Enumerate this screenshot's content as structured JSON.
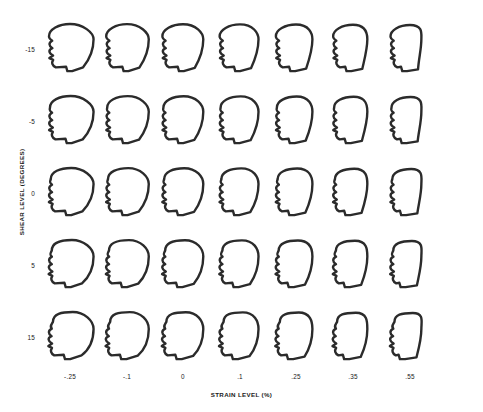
{
  "figure": {
    "type": "face-glyph-matrix",
    "title": "",
    "x_axis": {
      "label": "STRAIN LEVEL (%)",
      "ticks": [
        ".25",
        ".1",
        "0",
        ".1",
        ".25",
        ".35",
        ".55"
      ],
      "tick_display": [
        "-.25",
        "-.1",
        "0",
        ".1",
        ".25",
        ".35",
        ".55"
      ]
    },
    "y_axis": {
      "label": "SHEAR LEVEL (DEGREES)",
      "ticks": [
        "-15",
        "-5",
        "0",
        "5",
        "15"
      ]
    },
    "colors": {
      "background": "#ffffff",
      "stroke": "#2b2b2b",
      "text": "#1a1a1a"
    }
  },
  "chart_data": {
    "type": "scatter",
    "title": "",
    "xlabel": "STRAIN LEVEL (%)",
    "ylabel": "SHEAR LEVEL (DEGREES)",
    "glyph": "face-profile",
    "x": [
      -0.25,
      -0.1,
      0,
      0.1,
      0.25,
      0.35,
      0.55
    ],
    "y": [
      -15,
      -5,
      0,
      5,
      15
    ],
    "xtick_labels": [
      "-.25",
      "-.1",
      "0",
      ".1",
      ".25",
      ".35",
      ".55"
    ],
    "ytick_labels": [
      "-15",
      "-5",
      "0",
      "5",
      "15"
    ],
    "grid": false,
    "legend": "none",
    "note": "7 columns x 5 rows = 35 face glyphs; face roundness decreases and jaw angularity increases left-to-right; head tilt/elongation increases top-to-bottom",
    "cells": [
      {
        "row": 0,
        "col": 0,
        "shear": -15,
        "strain": -0.25,
        "roundness": 1.0,
        "tilt": -0.18
      },
      {
        "row": 0,
        "col": 1,
        "shear": -15,
        "strain": -0.1,
        "roundness": 0.88,
        "tilt": -0.18
      },
      {
        "row": 0,
        "col": 2,
        "shear": -15,
        "strain": 0.0,
        "roundness": 0.78,
        "tilt": -0.18
      },
      {
        "row": 0,
        "col": 3,
        "shear": -15,
        "strain": 0.1,
        "roundness": 0.66,
        "tilt": -0.18
      },
      {
        "row": 0,
        "col": 4,
        "shear": -15,
        "strain": 0.25,
        "roundness": 0.52,
        "tilt": -0.18
      },
      {
        "row": 0,
        "col": 5,
        "shear": -15,
        "strain": 0.35,
        "roundness": 0.38,
        "tilt": -0.18
      },
      {
        "row": 0,
        "col": 6,
        "shear": -15,
        "strain": 0.55,
        "roundness": 0.18,
        "tilt": -0.18
      },
      {
        "row": 1,
        "col": 0,
        "shear": -5,
        "strain": -0.25,
        "roundness": 1.0,
        "tilt": -0.08
      },
      {
        "row": 1,
        "col": 1,
        "shear": -5,
        "strain": -0.1,
        "roundness": 0.88,
        "tilt": -0.08
      },
      {
        "row": 1,
        "col": 2,
        "shear": -5,
        "strain": 0.0,
        "roundness": 0.78,
        "tilt": -0.08
      },
      {
        "row": 1,
        "col": 3,
        "shear": -5,
        "strain": 0.1,
        "roundness": 0.66,
        "tilt": -0.08
      },
      {
        "row": 1,
        "col": 4,
        "shear": -5,
        "strain": 0.25,
        "roundness": 0.52,
        "tilt": -0.08
      },
      {
        "row": 1,
        "col": 5,
        "shear": -5,
        "strain": 0.35,
        "roundness": 0.38,
        "tilt": -0.08
      },
      {
        "row": 1,
        "col": 6,
        "shear": -5,
        "strain": 0.55,
        "roundness": 0.18,
        "tilt": -0.08
      },
      {
        "row": 2,
        "col": 0,
        "shear": 0,
        "strain": -0.25,
        "roundness": 1.0,
        "tilt": 0.0
      },
      {
        "row": 2,
        "col": 1,
        "shear": 0,
        "strain": -0.1,
        "roundness": 0.88,
        "tilt": 0.0
      },
      {
        "row": 2,
        "col": 2,
        "shear": 0,
        "strain": 0.0,
        "roundness": 0.78,
        "tilt": 0.0
      },
      {
        "row": 2,
        "col": 3,
        "shear": 0,
        "strain": 0.1,
        "roundness": 0.66,
        "tilt": 0.0
      },
      {
        "row": 2,
        "col": 4,
        "shear": 0,
        "strain": 0.25,
        "roundness": 0.52,
        "tilt": 0.0
      },
      {
        "row": 2,
        "col": 5,
        "shear": 0,
        "strain": 0.35,
        "roundness": 0.38,
        "tilt": 0.0
      },
      {
        "row": 2,
        "col": 6,
        "shear": 0,
        "strain": 0.55,
        "roundness": 0.18,
        "tilt": 0.0
      },
      {
        "row": 3,
        "col": 0,
        "shear": 5,
        "strain": -0.25,
        "roundness": 1.0,
        "tilt": 0.1
      },
      {
        "row": 3,
        "col": 1,
        "shear": 5,
        "strain": -0.1,
        "roundness": 0.88,
        "tilt": 0.1
      },
      {
        "row": 3,
        "col": 2,
        "shear": 5,
        "strain": 0.0,
        "roundness": 0.78,
        "tilt": 0.1
      },
      {
        "row": 3,
        "col": 3,
        "shear": 5,
        "strain": 0.1,
        "roundness": 0.66,
        "tilt": 0.1
      },
      {
        "row": 3,
        "col": 4,
        "shear": 5,
        "strain": 0.25,
        "roundness": 0.52,
        "tilt": 0.1
      },
      {
        "row": 3,
        "col": 5,
        "shear": 5,
        "strain": 0.35,
        "roundness": 0.38,
        "tilt": 0.1
      },
      {
        "row": 3,
        "col": 6,
        "shear": 5,
        "strain": 0.55,
        "roundness": 0.18,
        "tilt": 0.1
      },
      {
        "row": 4,
        "col": 0,
        "shear": 15,
        "strain": -0.25,
        "roundness": 1.0,
        "tilt": 0.22
      },
      {
        "row": 4,
        "col": 1,
        "shear": 15,
        "strain": -0.1,
        "roundness": 0.88,
        "tilt": 0.22
      },
      {
        "row": 4,
        "col": 2,
        "shear": 15,
        "strain": 0.0,
        "roundness": 0.78,
        "tilt": 0.22
      },
      {
        "row": 4,
        "col": 3,
        "shear": 15,
        "strain": 0.1,
        "roundness": 0.66,
        "tilt": 0.22
      },
      {
        "row": 4,
        "col": 4,
        "shear": 15,
        "strain": 0.25,
        "roundness": 0.52,
        "tilt": 0.22
      },
      {
        "row": 4,
        "col": 5,
        "shear": 15,
        "strain": 0.35,
        "roundness": 0.38,
        "tilt": 0.22
      },
      {
        "row": 4,
        "col": 6,
        "shear": 15,
        "strain": 0.55,
        "roundness": 0.18,
        "tilt": 0.22
      }
    ]
  }
}
